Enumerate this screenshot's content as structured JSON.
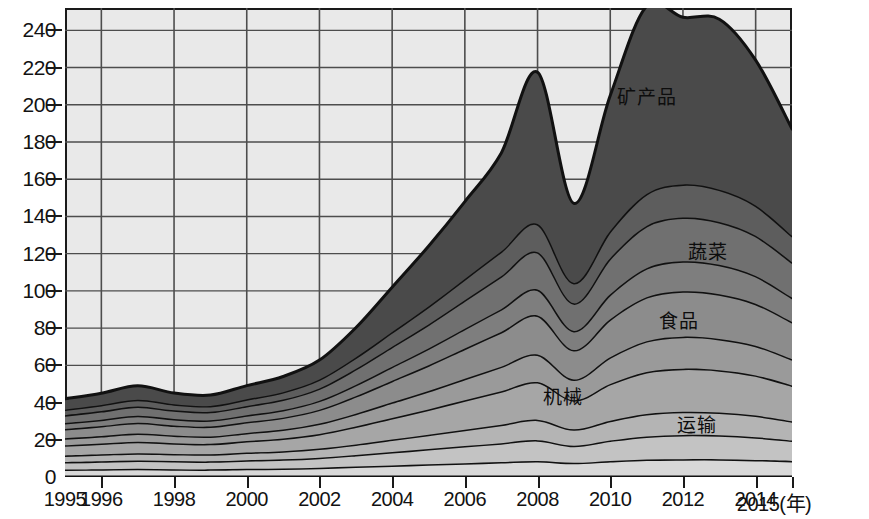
{
  "chart_data": {
    "type": "area",
    "title": "",
    "subtitle": "",
    "xlabel": "年",
    "ylabel": "",
    "stacked": true,
    "grid": true,
    "legend_position": "in-plot-labels",
    "xlim": [
      1995,
      2015
    ],
    "ylim": [
      0,
      252
    ],
    "yticks": [
      0,
      20,
      40,
      60,
      80,
      100,
      120,
      140,
      160,
      180,
      200,
      220,
      240
    ],
    "xticks": [
      1995,
      1996,
      1998,
      2000,
      2002,
      2004,
      2006,
      2008,
      2010,
      2012,
      2014,
      2015
    ],
    "x": [
      1995,
      1996,
      1997,
      1998,
      1999,
      2000,
      2001,
      2002,
      2003,
      2004,
      2005,
      2006,
      2007,
      2008,
      2009,
      2010,
      2011,
      2012,
      2013,
      2014,
      2015
    ],
    "annotations": [
      {
        "text": "矿产品",
        "x": 2011.0,
        "y": 205
      },
      {
        "text": "蔬菜",
        "x": 2012.7,
        "y": 122
      },
      {
        "text": "食品",
        "x": 2011.9,
        "y": 85
      },
      {
        "text": "机械",
        "x": 2008.7,
        "y": 44
      },
      {
        "text": "运输",
        "x": 2012.4,
        "y": 29
      }
    ],
    "series": [
      {
        "name": "层1",
        "label": "",
        "color": "#d8d8d8",
        "values": [
          4.0,
          4.2,
          4.4,
          4.2,
          4.1,
          4.4,
          4.6,
          5.0,
          5.6,
          6.2,
          6.8,
          7.4,
          8.0,
          8.6,
          7.6,
          8.6,
          9.4,
          9.6,
          9.6,
          9.2,
          8.6
        ]
      },
      {
        "name": "运输",
        "label": "运输",
        "color": "#c3c3c3",
        "values": [
          4.0,
          4.2,
          4.4,
          4.4,
          4.3,
          4.6,
          4.9,
          5.4,
          6.2,
          7.2,
          8.2,
          9.2,
          10.2,
          11.2,
          9.2,
          11.0,
          12.4,
          13.0,
          12.8,
          12.2,
          11.0
        ]
      },
      {
        "name": "层3",
        "label": "",
        "color": "#b4b4b4",
        "values": [
          3.6,
          3.8,
          4.0,
          3.8,
          3.8,
          4.1,
          4.4,
          4.9,
          5.7,
          6.7,
          7.7,
          8.8,
          9.9,
          11.0,
          8.8,
          10.6,
          12.0,
          12.4,
          12.2,
          11.6,
          10.4
        ]
      },
      {
        "name": "机械",
        "label": "机械",
        "color": "#a6a6a6",
        "values": [
          5.4,
          5.8,
          6.2,
          5.8,
          5.6,
          6.2,
          6.8,
          7.8,
          9.6,
          11.6,
          13.6,
          15.8,
          18.0,
          20.2,
          15.6,
          19.8,
          22.6,
          23.2,
          22.8,
          21.6,
          19.2
        ]
      },
      {
        "name": "层5",
        "label": "",
        "color": "#9a9a9a",
        "values": [
          3.8,
          4.0,
          4.4,
          4.1,
          4.0,
          4.4,
          4.8,
          5.6,
          6.9,
          8.4,
          9.9,
          11.6,
          13.2,
          14.8,
          11.2,
          14.4,
          16.6,
          17.2,
          16.8,
          15.9,
          14.1
        ]
      },
      {
        "name": "食品",
        "label": "食品",
        "color": "#8c8c8c",
        "values": [
          5.0,
          5.4,
          5.8,
          5.4,
          5.3,
          5.8,
          6.4,
          7.5,
          9.4,
          11.6,
          13.8,
          16.2,
          18.6,
          21.0,
          15.8,
          20.4,
          23.6,
          24.4,
          24.0,
          22.6,
          20.0
        ]
      },
      {
        "name": "层7",
        "label": "",
        "color": "#7e7e7e",
        "values": [
          3.2,
          3.4,
          3.7,
          3.5,
          3.4,
          3.7,
          4.1,
          4.8,
          6.1,
          7.6,
          9.1,
          10.7,
          12.3,
          13.9,
          10.3,
          13.4,
          15.6,
          16.1,
          15.8,
          14.9,
          13.1
        ]
      },
      {
        "name": "蔬菜",
        "label": "蔬菜",
        "color": "#707070",
        "values": [
          4.2,
          4.6,
          5.0,
          4.6,
          4.5,
          5.0,
          5.6,
          6.6,
          8.5,
          10.7,
          12.9,
          15.3,
          17.7,
          20.1,
          14.8,
          19.4,
          22.7,
          23.5,
          23.0,
          21.6,
          19.0
        ]
      },
      {
        "name": "层9",
        "label": "",
        "color": "#5d5d5d",
        "values": [
          3.0,
          3.3,
          3.6,
          3.3,
          3.2,
          3.6,
          4.0,
          4.8,
          6.2,
          7.9,
          9.6,
          11.4,
          13.3,
          15.1,
          11.0,
          14.6,
          17.2,
          17.8,
          17.4,
          16.3,
          14.2
        ]
      },
      {
        "name": "矿产品",
        "label": "矿产品",
        "color": "#4a4a4a",
        "values": [
          5.8,
          6.3,
          7.5,
          6.0,
          5.8,
          7.3,
          8.4,
          10.4,
          16.0,
          24.1,
          32.4,
          41.6,
          52.8,
          81.6,
          42.7,
          72.8,
          100.9,
          89.8,
          91.6,
          78.1,
          57.4
        ]
      }
    ],
    "totals": [
      41.0,
      45.0,
      49.0,
      41.1,
      40.0,
      45.1,
      50.0,
      62.8,
      80.2,
      102.0,
      124.0,
      148.0,
      174.0,
      222.5,
      147.0,
      205.0,
      252.0,
      247.0,
      246.0,
      224.0,
      187.0
    ]
  }
}
